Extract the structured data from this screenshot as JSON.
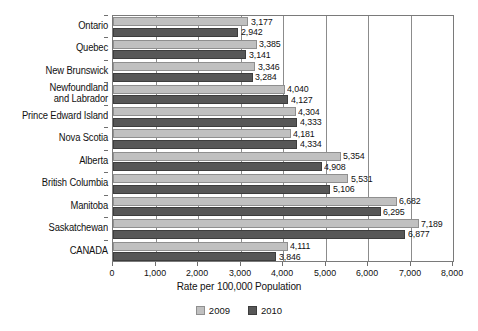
{
  "chart_data": {
    "type": "bar",
    "orientation": "horizontal",
    "title": "",
    "xlabel": "Rate per 100,000 Population",
    "ylabel": "",
    "xlim": [
      0,
      8000
    ],
    "xticks": [
      "0",
      "1,000",
      "2,000",
      "3,000",
      "4,000",
      "5,000",
      "6,000",
      "7,000",
      "8,000"
    ],
    "xtick_values": [
      0,
      1000,
      2000,
      3000,
      4000,
      5000,
      6000,
      7000,
      8000
    ],
    "grid": true,
    "legend_position": "bottom",
    "categories": [
      "Ontario",
      "Quebec",
      "New Brunswick",
      "Newfoundland and Labrador",
      "Prince Edward Island",
      "Nova Scotia",
      "Alberta",
      "British Columbia",
      "Manitoba",
      "Saskatchewan",
      "CANADA"
    ],
    "category_lines": [
      [
        "Ontario"
      ],
      [
        "Quebec"
      ],
      [
        "New Brunswick"
      ],
      [
        "Newfoundland",
        "and Labrador"
      ],
      [
        "Prince Edward Island"
      ],
      [
        "Nova Scotia"
      ],
      [
        "Alberta"
      ],
      [
        "British Columbia"
      ],
      [
        "Manitoba"
      ],
      [
        "Saskatchewan"
      ],
      [
        "CANADA"
      ]
    ],
    "series": [
      {
        "name": "2009",
        "color": "#c0c0c0",
        "values": [
          3177,
          3385,
          3346,
          4040,
          4304,
          4181,
          5354,
          5531,
          6682,
          7189,
          4111
        ],
        "labels": [
          "3,177",
          "3,385",
          "3,346",
          "4,040",
          "4,304",
          "4,181",
          "5,354",
          "5,531",
          "6,682",
          "7,189",
          "4,111"
        ]
      },
      {
        "name": "2010",
        "color": "#575757",
        "values": [
          2942,
          3141,
          3284,
          4127,
          4333,
          4334,
          4908,
          5106,
          6295,
          6877,
          3846
        ],
        "labels": [
          "2,942",
          "3,141",
          "3,284",
          "4,127",
          "4,333",
          "4,334",
          "4,908",
          "5,106",
          "6,295",
          "6,877",
          "3,846"
        ]
      }
    ]
  },
  "legend": {
    "items": [
      {
        "label": "2009",
        "color": "#c0c0c0"
      },
      {
        "label": "2010",
        "color": "#575757"
      }
    ]
  }
}
